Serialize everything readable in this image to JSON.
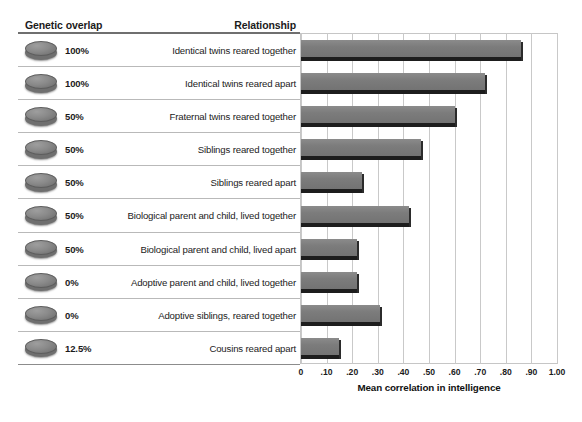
{
  "table": {
    "header_genetic": "Genetic overlap",
    "header_relationship": "Relationship"
  },
  "axis": {
    "title": "Mean correlation in intelligence",
    "ticks": [
      "0",
      ".10",
      ".20",
      ".30",
      ".40",
      ".50",
      ".60",
      ".70",
      ".80",
      ".90",
      "1.00"
    ],
    "tick_values": [
      0,
      0.1,
      0.2,
      0.3,
      0.4,
      0.5,
      0.6,
      0.7,
      0.8,
      0.9,
      1.0
    ]
  },
  "colors": {
    "bar_fill": "#7c7c7c",
    "bar_shadow": "#1d1d1d",
    "grid": "#c9c9c9",
    "rule": "#6f6f6f",
    "text": "#1b1b1b",
    "coin": "#8a8a8a"
  },
  "rows": [
    {
      "genetic_overlap": "100%",
      "relationship": "Identical twins reared together",
      "correlation": 0.86,
      "icon": "genetic-disc-icon"
    },
    {
      "genetic_overlap": "100%",
      "relationship": "Identical twins reared apart",
      "correlation": 0.72,
      "icon": "genetic-disc-icon"
    },
    {
      "genetic_overlap": "50%",
      "relationship": "Fraternal twins reared together",
      "correlation": 0.6,
      "icon": "genetic-disc-icon"
    },
    {
      "genetic_overlap": "50%",
      "relationship": "Siblings reared together",
      "correlation": 0.47,
      "icon": "genetic-disc-icon"
    },
    {
      "genetic_overlap": "50%",
      "relationship": "Siblings reared apart",
      "correlation": 0.24,
      "icon": "genetic-disc-icon"
    },
    {
      "genetic_overlap": "50%",
      "relationship": "Biological parent and child, lived together",
      "correlation": 0.42,
      "icon": "genetic-disc-icon"
    },
    {
      "genetic_overlap": "50%",
      "relationship": "Biological parent and child, lived apart",
      "correlation": 0.22,
      "icon": "genetic-disc-icon"
    },
    {
      "genetic_overlap": "0%",
      "relationship": "Adoptive parent and child, lived together",
      "correlation": 0.22,
      "icon": "genetic-disc-icon"
    },
    {
      "genetic_overlap": "0%",
      "relationship": "Adoptive siblings, reared together",
      "correlation": 0.31,
      "icon": "genetic-disc-icon"
    },
    {
      "genetic_overlap": "12.5%",
      "relationship": "Cousins reared apart",
      "correlation": 0.15,
      "icon": "genetic-disc-icon"
    }
  ],
  "chart_data": {
    "type": "bar",
    "orientation": "horizontal",
    "title": "",
    "xlabel": "Mean correlation in intelligence",
    "ylabel": "",
    "xlim": [
      0,
      1.0
    ],
    "grid": true,
    "legend": false,
    "categories": [
      "Identical twins reared together",
      "Identical twins reared apart",
      "Fraternal twins reared together",
      "Siblings reared together",
      "Siblings reared apart",
      "Biological parent and child, lived together",
      "Biological parent and child, lived apart",
      "Adoptive parent and child, lived together",
      "Adoptive siblings, reared together",
      "Cousins reared apart"
    ],
    "values": [
      0.86,
      0.72,
      0.6,
      0.47,
      0.24,
      0.42,
      0.22,
      0.22,
      0.31,
      0.15
    ],
    "tick_labels": [
      "0",
      ".10",
      ".20",
      ".30",
      ".40",
      ".50",
      ".60",
      ".70",
      ".80",
      ".90",
      "1.00"
    ]
  }
}
